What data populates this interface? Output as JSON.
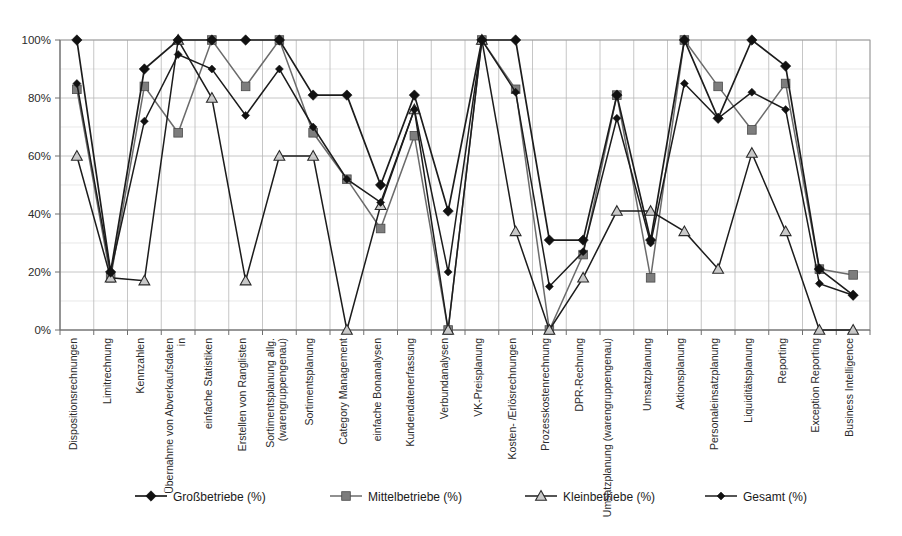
{
  "chart_data": {
    "type": "line",
    "title": "",
    "subtitle": "",
    "xlabel": "",
    "ylabel": "",
    "ylim": [
      0,
      100
    ],
    "ytick_labels": [
      "0%",
      "20%",
      "40%",
      "60%",
      "80%",
      "100%"
    ],
    "ytick_values": [
      0,
      20,
      40,
      60,
      80,
      100
    ],
    "grid": true,
    "legend_position": "bottom",
    "categories": [
      "Dispositionsrechnungen",
      "Limitrechnung",
      "Kennzahlen",
      "Übernahme von Abverkaufsdaten in",
      "einfache Statistiken",
      "Erstellen von Ranglisten",
      "Sortimentsplanung allg. (warengruppengenau)",
      "Sortimentsplanung",
      "Category Management",
      "einfache Bonanalysen",
      "Kundendatenerfassung",
      "Verbundanalysen",
      "VK-Preisplanung",
      "Kosten- /Erlösrechnungen",
      "Prozesskostenrechnung",
      "DPR-Rechnung",
      "Umsatzplanung (warengruppengenau)",
      "Umsatzplanung",
      "Aktionsplanung",
      "Personaleinsatzplanung",
      "Liquiditätsplanung",
      "Reporting",
      "Exception Reporting",
      "Business Intelligence"
    ],
    "series": [
      {
        "name": "Großbetriebe (%)",
        "marker": "diamond",
        "color": "#111111",
        "values": [
          100,
          20,
          90,
          100,
          100,
          100,
          100,
          81,
          81,
          50,
          81,
          41,
          100,
          100,
          31,
          31,
          81,
          31,
          100,
          73,
          100,
          91,
          21,
          12
        ]
      },
      {
        "name": "Mittelbetriebe (%)",
        "marker": "square",
        "color": "#7d7d7d",
        "values": [
          83,
          18,
          84,
          68,
          100,
          84,
          100,
          68,
          52,
          35,
          67,
          0,
          100,
          83,
          0,
          26,
          81,
          18,
          100,
          84,
          69,
          85,
          21,
          19
        ]
      },
      {
        "name": "Kleinbetriebe (%)",
        "marker": "triangle",
        "color": "#c9c9c9",
        "values": [
          60,
          18,
          17,
          100,
          80,
          17,
          60,
          60,
          0,
          43,
          76,
          0,
          100,
          34,
          0,
          18,
          41,
          41,
          34,
          21,
          61,
          34,
          0,
          0
        ]
      },
      {
        "name": "Gesamt (%)",
        "marker": "small-diamond",
        "color": "#111111",
        "values": [
          85,
          20,
          72,
          95,
          90,
          74,
          90,
          70,
          52,
          44,
          76,
          20,
          100,
          82,
          15,
          27,
          73,
          30,
          85,
          73,
          82,
          76,
          16,
          12
        ]
      }
    ]
  },
  "legend": {
    "items": [
      {
        "label": "Großbetriebe (%)",
        "marker": "diamond"
      },
      {
        "label": "Mittelbetriebe (%)",
        "marker": "square"
      },
      {
        "label": "Kleinbetriebe (%)",
        "marker": "triangle"
      },
      {
        "label": "Gesamt (%)",
        "marker": "small-diamond"
      }
    ]
  }
}
